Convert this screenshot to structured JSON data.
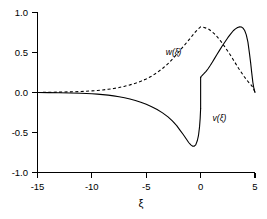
{
  "chart_data": {
    "type": "line",
    "title": "",
    "subtitle": "",
    "xlabel": "ξ",
    "ylabel": "",
    "xlim": [
      -15,
      5
    ],
    "ylim": [
      -1.0,
      1.0
    ],
    "grid": false,
    "legend_position": "inline-annotation",
    "xticks": [
      -15,
      -10,
      -5,
      0,
      5
    ],
    "xticklabels": [
      "-15",
      "-10",
      "-5",
      "0",
      "5"
    ],
    "yticks": [
      -1.0,
      -0.5,
      0.0,
      0.5,
      1.0
    ],
    "yticklabels": [
      "-1.0",
      "-0.5",
      "0.0",
      "0.5",
      "1.0"
    ],
    "annotations": [
      {
        "text": "w(ξ)",
        "x": -3.2,
        "y": 0.47
      },
      {
        "text": "v(ξ)",
        "x": 1.1,
        "y": -0.35
      }
    ],
    "series": [
      {
        "name": "w(ξ)",
        "style": "dashed",
        "color": "#000000",
        "x": [
          -15,
          -14,
          -13,
          -12,
          -11,
          -10,
          -9.5,
          -9,
          -8.5,
          -8,
          -7.5,
          -7,
          -6.5,
          -6,
          -5.5,
          -5,
          -4.5,
          -4,
          -3.5,
          -3,
          -2.5,
          -2,
          -1.5,
          -1,
          -0.5,
          -0.25,
          0,
          0.25,
          0.5,
          0.75,
          1,
          1.25,
          1.5,
          1.75,
          2,
          2.25,
          2.5,
          2.75,
          3,
          3.25,
          3.5,
          3.75,
          4,
          4.25,
          4.5,
          4.7,
          4.85,
          4.95,
          5
        ],
        "y": [
          0.0,
          0.003,
          0.005,
          0.008,
          0.012,
          0.02,
          0.025,
          0.032,
          0.04,
          0.05,
          0.062,
          0.077,
          0.095,
          0.115,
          0.14,
          0.17,
          0.205,
          0.25,
          0.3,
          0.36,
          0.43,
          0.51,
          0.59,
          0.67,
          0.755,
          0.79,
          0.82,
          0.815,
          0.805,
          0.79,
          0.765,
          0.735,
          0.7,
          0.66,
          0.615,
          0.565,
          0.515,
          0.465,
          0.41,
          0.355,
          0.3,
          0.25,
          0.2,
          0.155,
          0.115,
          0.085,
          0.05,
          0.02,
          0.0
        ]
      },
      {
        "name": "v(ξ)",
        "style": "solid",
        "color": "#000000",
        "segments": [
          {
            "x": [
              -15,
              -14,
              -13,
              -12,
              -11,
              -10,
              -9.5,
              -9,
              -8.5,
              -8,
              -7.5,
              -7,
              -6.5,
              -6,
              -5.5,
              -5,
              -4.5,
              -4,
              -3.5,
              -3,
              -2.6,
              -2.2,
              -1.9,
              -1.6,
              -1.3,
              -1.1,
              -0.9,
              -0.75,
              -0.6,
              -0.45,
              -0.3,
              -0.2,
              -0.1,
              -0.04,
              0
            ],
            "y": [
              0.0,
              -0.002,
              -0.004,
              -0.006,
              -0.01,
              -0.015,
              -0.02,
              -0.026,
              -0.033,
              -0.042,
              -0.053,
              -0.066,
              -0.082,
              -0.1,
              -0.122,
              -0.148,
              -0.178,
              -0.213,
              -0.255,
              -0.305,
              -0.355,
              -0.415,
              -0.47,
              -0.525,
              -0.585,
              -0.625,
              -0.655,
              -0.67,
              -0.672,
              -0.655,
              -0.6,
              -0.54,
              -0.43,
              -0.32,
              -0.2
            ]
          },
          {
            "x": [
              0,
              0.05,
              0.15,
              0.3,
              0.5,
              0.7,
              0.9,
              1.1,
              1.3,
              1.5,
              1.75,
              2,
              2.25,
              2.5,
              2.75,
              3,
              3.2,
              3.4,
              3.6,
              3.75,
              3.9,
              4.05,
              4.2,
              4.35,
              4.5,
              4.6,
              4.7,
              4.8,
              4.9,
              5
            ],
            "y": [
              0.19,
              0.2,
              0.215,
              0.235,
              0.265,
              0.3,
              0.34,
              0.385,
              0.43,
              0.475,
              0.53,
              0.585,
              0.635,
              0.685,
              0.73,
              0.772,
              0.795,
              0.812,
              0.82,
              0.818,
              0.805,
              0.775,
              0.72,
              0.63,
              0.48,
              0.37,
              0.245,
              0.13,
              0.05,
              0.0
            ]
          }
        ]
      }
    ]
  },
  "axis": {
    "x_tick_labels": [
      "-15",
      "-10",
      "-5",
      "0",
      "5"
    ],
    "y_tick_labels": [
      "1.0",
      "0.5",
      "0.0",
      "-0.5",
      "-1.0"
    ],
    "x_axis_title": "ξ"
  },
  "labels": {
    "w_label": "w(ξ)",
    "v_label": "v(ξ)"
  }
}
